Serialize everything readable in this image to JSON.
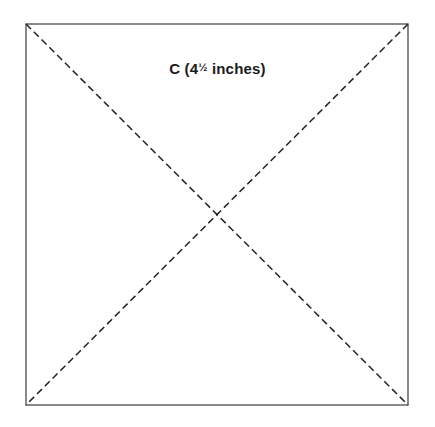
{
  "figure": {
    "kind": "geometry-diagram",
    "background_color": "#ffffff",
    "square": {
      "name": "C",
      "stroke_color": "#55595c",
      "stroke_width": 1.4,
      "fill": "none",
      "left": 26,
      "top": 24,
      "right": 408,
      "bottom": 405,
      "width": 382,
      "height": 381
    },
    "diagonals": {
      "stroke_color": "#222222",
      "stroke_width": 1.5,
      "dash_length": 7,
      "gap_length": 4,
      "lines": [
        {
          "name": "diagonal-tl-br",
          "x1": 26,
          "y1": 24,
          "x2": 408,
          "y2": 405
        },
        {
          "name": "diagonal-tr-bl",
          "x1": 408,
          "y1": 24,
          "x2": 26,
          "y2": 405
        }
      ],
      "intersection": {
        "x": 217,
        "y": 214
      }
    },
    "label": {
      "full_text": "C (4½ inches)",
      "prefix": "C (4",
      "fraction": "½",
      "suffix": " inches)",
      "color": "#1a1a1a",
      "font_size_px": 15,
      "center_x": 216,
      "baseline_y": 76
    }
  }
}
